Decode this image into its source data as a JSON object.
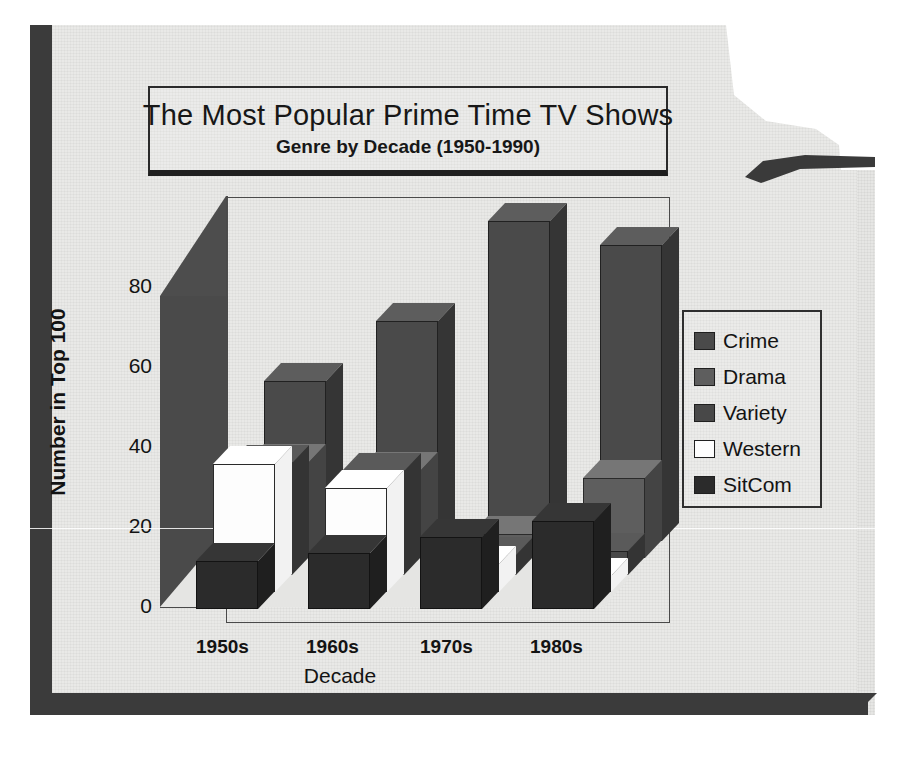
{
  "title": "The Most Popular Prime Time TV Shows",
  "subtitle": "Genre by Decade (1950-1990)",
  "axes": {
    "ylabel": "Number in Top 100",
    "xlabel": "Decade",
    "yticks": [
      "0",
      "20",
      "40",
      "60",
      "80"
    ],
    "xticks": [
      "1950s",
      "1960s",
      "1970s",
      "1980s"
    ]
  },
  "legend": {
    "items": [
      {
        "label": "Crime",
        "color": "#4a4a4a"
      },
      {
        "label": "Drama",
        "color": "#5e5e5e"
      },
      {
        "label": "Variety",
        "color": "#484848"
      },
      {
        "label": "Western",
        "color": "#fdfdfd"
      },
      {
        "label": "SitCom",
        "color": "#2b2b2b"
      }
    ]
  },
  "chart_data": {
    "type": "bar",
    "title": "The Most Popular Prime Time TV Shows",
    "subtitle": "Genre by Decade (1950-1990)",
    "xlabel": "Decade",
    "ylabel": "Number in Top 100",
    "ylim": [
      0,
      90
    ],
    "yticks": [
      0,
      20,
      40,
      60,
      80
    ],
    "grid": false,
    "legend_position": "right",
    "projection": "3d",
    "categories": [
      "1950s",
      "1960s",
      "1970s",
      "1980s"
    ],
    "series": [
      {
        "name": "Crime",
        "color": "#4a4a4a",
        "values": [
          40,
          55,
          80,
          74
        ]
      },
      {
        "name": "Drama",
        "color": "#5e5e5e",
        "values": [
          24,
          22,
          6,
          20
        ]
      },
      {
        "name": "Variety",
        "color": "#484848",
        "values": [
          28,
          26,
          5,
          6
        ]
      },
      {
        "name": "Western",
        "color": "#fdfdfd",
        "values": [
          32,
          26,
          7,
          4
        ]
      },
      {
        "name": "SitCom",
        "color": "#2b2b2b",
        "values": [
          12,
          14,
          18,
          22
        ]
      }
    ]
  }
}
